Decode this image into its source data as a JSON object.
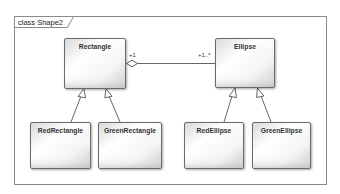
{
  "frame": {
    "label": "class Shape2"
  },
  "classes": {
    "rectangle": {
      "name": "Rectangle"
    },
    "ellipse": {
      "name": "Ellipse"
    },
    "red_rectangle": {
      "name": "RedRectangle"
    },
    "green_rectangle": {
      "name": "GreenRectangle"
    },
    "red_ellipse": {
      "name": "RedEllipse"
    },
    "green_ellipse": {
      "name": "GreenEllipse"
    }
  },
  "relationships": {
    "aggregation": {
      "type": "aggregation",
      "source": "Rectangle",
      "target": "Ellipse",
      "source_multiplicity": "+1",
      "target_multiplicity": "+1..*"
    },
    "generalizations": [
      {
        "child": "RedRectangle",
        "parent": "Rectangle"
      },
      {
        "child": "GreenRectangle",
        "parent": "Rectangle"
      },
      {
        "child": "RedEllipse",
        "parent": "Ellipse"
      },
      {
        "child": "GreenEllipse",
        "parent": "Ellipse"
      }
    ]
  },
  "colors": {
    "border": "#6b6b6b",
    "frame_border": "#8a8a8a",
    "box_light": "#ffffff",
    "box_dark": "#c8c8c8",
    "line": "#555555"
  }
}
